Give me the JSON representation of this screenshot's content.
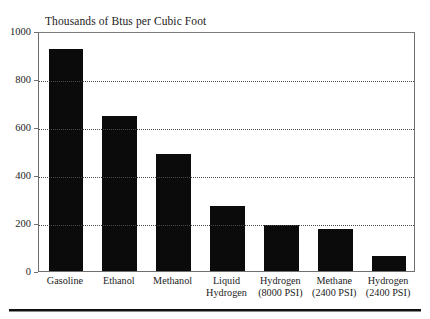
{
  "chart_data": {
    "type": "bar",
    "title": "Thousands of Btus per Cubic Foot",
    "xlabel": "",
    "ylabel": "",
    "ylim": [
      0,
      1000
    ],
    "yticks": [
      0,
      200,
      400,
      600,
      800,
      1000
    ],
    "ytick_labels": [
      "0",
      "200",
      "400",
      "600",
      "800",
      "1000"
    ],
    "grid": "horizontal-dotted",
    "legend": "none",
    "bar_color": "#0b0b0b",
    "categories": [
      "Gasoline",
      "Ethanol",
      "Methanol",
      "Liquid Hydrogen",
      "Hydrogen (8000 PSI)",
      "Methane (2400 PSI)",
      "Hydrogen (2400 PSI)"
    ],
    "category_lines": [
      [
        "Gasoline",
        ""
      ],
      [
        "Ethanol",
        ""
      ],
      [
        "Methanol",
        ""
      ],
      [
        "Liquid",
        "Hydrogen"
      ],
      [
        "Hydrogen",
        "(8000 PSI)"
      ],
      [
        "Methane",
        "(2400 PSI)"
      ],
      [
        "Hydrogen",
        "(2400 PSI)"
      ]
    ],
    "values": [
      925,
      645,
      488,
      270,
      192,
      173,
      63
    ]
  }
}
